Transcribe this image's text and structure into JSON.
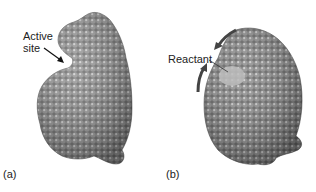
{
  "figure": {
    "panels": [
      {
        "id": "a",
        "panel_label": "(a)",
        "annotation_line1": "Active",
        "annotation_line2": "site",
        "colors": {
          "protein": "#8a8a8a",
          "arrow": "#111111"
        }
      },
      {
        "id": "b",
        "panel_label": "(b)",
        "annotation": "Reactant",
        "colors": {
          "protein": "#7d7d7d",
          "reactant": "#b5b5b5",
          "arrow": "#333333"
        }
      }
    ]
  }
}
